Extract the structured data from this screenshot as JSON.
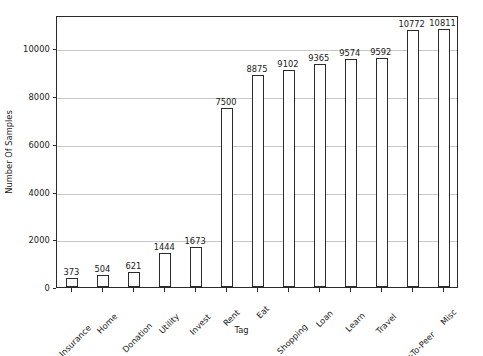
{
  "chart_data": {
    "type": "bar",
    "title": "",
    "xlabel": "Tag",
    "ylabel": "Number Of Samples",
    "categories": [
      "Insurance",
      "Home",
      "Donation",
      "Utility",
      "Invest",
      "Rent",
      "Eat",
      "Shopping",
      "Loan",
      "Learn",
      "Travel",
      "Peer-To-Peer",
      "Misc"
    ],
    "values": [
      373,
      504,
      621,
      1444,
      1673,
      7500,
      8875,
      9102,
      9365,
      9574,
      9592,
      10772,
      10811
    ],
    "value_labels": [
      "373",
      "504",
      "621",
      "1444",
      "1673",
      "7500",
      "8875",
      "9102",
      "9365",
      "9574",
      "9592",
      "10772",
      "10811"
    ],
    "ylim": [
      0,
      11400
    ],
    "yticks": [
      0,
      2000,
      4000,
      6000,
      8000,
      10000
    ],
    "ytick_labels": [
      "0",
      "2000",
      "4000",
      "6000",
      "8000",
      "10000"
    ],
    "grid": true,
    "grid_axis": "y",
    "legend": null,
    "bar_facecolor": "#ffffff",
    "bar_edgecolor": "#2b2b2b",
    "grid_color": "#c8c8c8",
    "axes_color": "#2b2b2b",
    "background": "#ffffff",
    "xtick_rotation": -45
  }
}
